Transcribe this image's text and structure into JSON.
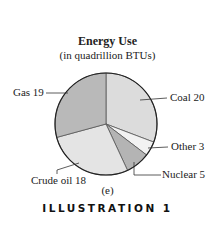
{
  "chart_data": {
    "type": "pie",
    "title": "Energy Use",
    "subtitle": "(in quadrillion BTUs)",
    "categories": [
      "Coal",
      "Other",
      "Nuclear",
      "Crude oil",
      "Gas"
    ],
    "values": [
      20,
      3,
      5,
      18,
      19
    ],
    "labels": [
      "Coal 20",
      "Other 3",
      "Nuclear 5",
      "Crude oil 18",
      "Gas 19"
    ],
    "colors": [
      "#dcdcdc",
      "#f2f2f2",
      "#b4b4b4",
      "#e4e4e4",
      "#b9b9b9"
    ],
    "start_angle_deg": 0,
    "direction": "clockwise"
  },
  "caption": "(e)",
  "illustration_label": "ILLUSTRATION 1"
}
